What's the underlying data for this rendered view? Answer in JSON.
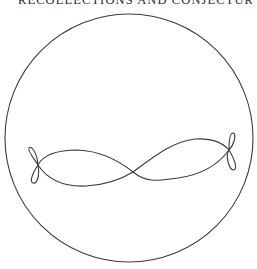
{
  "page": {
    "running_header": "RECOLLECTIONS AND CONJECTURES"
  },
  "figure": {
    "stroke_color": "#3a3a3a",
    "background": "#ffffff",
    "circle": {
      "cx": 129,
      "cy": 138,
      "r": 124
    },
    "curve": {
      "center_crossing": [
        133,
        172
      ],
      "left_loop_crossing": [
        38,
        165
      ],
      "right_loop_crossing": [
        229,
        150
      ]
    }
  }
}
